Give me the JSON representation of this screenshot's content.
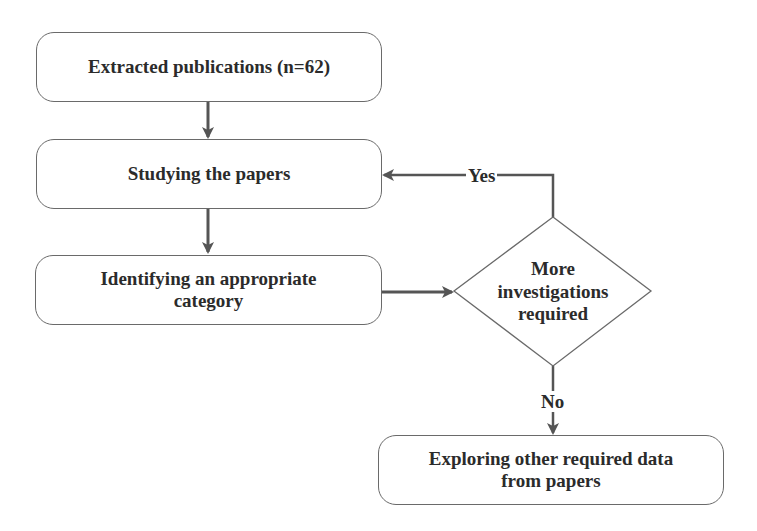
{
  "diagram": {
    "type": "flowchart",
    "nodes": [
      {
        "id": "extracted",
        "shape": "rounded-rect",
        "label": "Extracted publications (n=62)"
      },
      {
        "id": "studying",
        "shape": "rounded-rect",
        "label": "Studying the papers"
      },
      {
        "id": "identifying",
        "shape": "rounded-rect",
        "label_line1": "Identifying an appropriate",
        "label_line2": "category"
      },
      {
        "id": "decision",
        "shape": "diamond",
        "label_line1": "More",
        "label_line2": "investigations",
        "label_line3": "required"
      },
      {
        "id": "exploring",
        "shape": "rounded-rect",
        "label_line1": "Exploring other required data",
        "label_line2": "from papers"
      }
    ],
    "edges": [
      {
        "from": "extracted",
        "to": "studying",
        "label": ""
      },
      {
        "from": "studying",
        "to": "identifying",
        "label": ""
      },
      {
        "from": "identifying",
        "to": "decision",
        "label": ""
      },
      {
        "from": "decision",
        "to": "studying",
        "label": "Yes"
      },
      {
        "from": "decision",
        "to": "exploring",
        "label": "No"
      }
    ],
    "colors": {
      "stroke": "#6a6a6a",
      "arrow": "#555555",
      "text": "#2b2b2b",
      "background": "#ffffff"
    }
  }
}
